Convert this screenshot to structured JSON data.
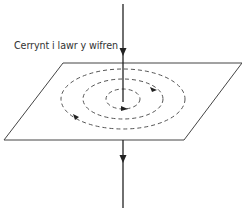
{
  "diagram": {
    "label": "Cerrynt i lawr y wifren",
    "colors": {
      "line": "#333333",
      "dashed": "#555555",
      "background": "#ffffff"
    },
    "wire": {
      "x": 123,
      "y_top": 4,
      "y_bottom": 208,
      "direction": "down"
    },
    "plane": {
      "points": [
        [
          63,
          63
        ],
        [
          242,
          63
        ],
        [
          184,
          140
        ],
        [
          4,
          140
        ]
      ]
    },
    "field_lines": [
      {
        "name": "inner",
        "cx": 123,
        "cy": 99,
        "rx": 17,
        "ry": 10
      },
      {
        "name": "middle",
        "cx": 123,
        "cy": 99,
        "rx": 40,
        "ry": 20
      },
      {
        "name": "outer",
        "cx": 123,
        "cy": 99,
        "rx": 62,
        "ry": 30
      }
    ]
  }
}
